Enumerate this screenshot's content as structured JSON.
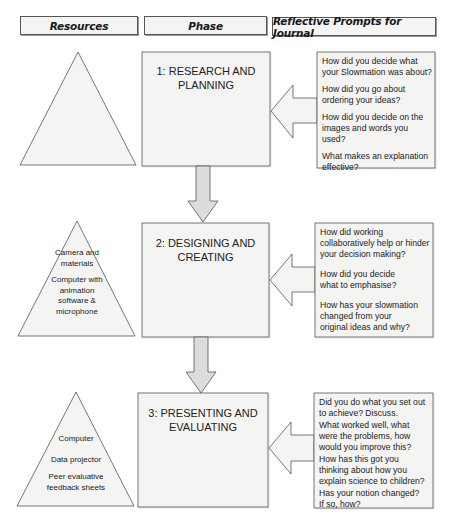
{
  "headers": {
    "resources": "Resources",
    "phase": "Phase",
    "prompts": "Reflective Prompts for Journal"
  },
  "phases": [
    {
      "title_line1": "1: RESEARCH AND",
      "title_line2": "PLANNING",
      "resources": [],
      "prompts": [
        "How did you decide what your Slowmation was about?",
        "How did you go about ordering your ideas?",
        "How did you decide on the images and words you used?",
        "What makes an explanation effective?"
      ]
    },
    {
      "title_line1": "2: DESIGNING AND",
      "title_line2": "CREATING",
      "resources": [
        "Camera and materials",
        "Computer with animation software & microphone"
      ],
      "prompts": [
        "How did working collaboratively help or hinder your decision making?",
        "How did you decide what to emphasise?",
        "How has your slowmation changed from your original ideas and why?"
      ]
    },
    {
      "title_line1": "3: PRESENTING AND",
      "title_line2": "EVALUATING",
      "resources": [
        "Computer",
        "Data projector",
        "Peer evaluative feedback sheets"
      ],
      "prompts": [
        "Did you do what you set out to achieve? Discuss.",
        "What worked well, what were the problems, how would you improve this?",
        "How has this got you thinking about how you explain science to children?",
        "Has your notion changed? If so, how?"
      ]
    }
  ],
  "colors": {
    "shape_fill": "#f3f3f1",
    "arrow_fill": "#dcdcda",
    "stroke": "#555555"
  }
}
